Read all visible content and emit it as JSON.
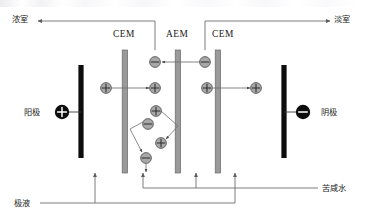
{
  "diagram": {
    "type": "electrodialysis-cell-schematic",
    "labels": {
      "concentrate_top_left": "浓室",
      "dilute_top_right": "淡室",
      "anode": "阳极",
      "cathode": "阴极",
      "electrode_solution_bottom_left": "极液",
      "brackish_water_bottom_right": "苦咸水"
    },
    "membranes": [
      {
        "id": "cem-1",
        "label": "CEM",
        "x": 125,
        "top": 50,
        "bottom": 173
      },
      {
        "id": "aem-1",
        "label": "AEM",
        "x": 178,
        "top": 50,
        "bottom": 173
      },
      {
        "id": "cem-2",
        "label": "CEM",
        "x": 218,
        "top": 50,
        "bottom": 173
      }
    ],
    "electrodes": [
      {
        "id": "anode",
        "polarity": "+",
        "sign_label": "+",
        "x": 81,
        "top": 65,
        "bottom": 158
      },
      {
        "id": "cathode",
        "polarity": "-",
        "sign_label": "−",
        "x": 284,
        "top": 65,
        "bottom": 158
      }
    ],
    "ions": [
      {
        "id": "anion-top-mid",
        "charge": "−",
        "cx": 155,
        "cy": 62
      },
      {
        "id": "anion-top-right",
        "charge": "−",
        "cx": 205,
        "cy": 62
      },
      {
        "id": "cation-left-outer",
        "charge": "+",
        "cx": 106,
        "cy": 88
      },
      {
        "id": "cation-left-inner",
        "charge": "+",
        "cx": 155,
        "cy": 88
      },
      {
        "id": "cation-right-outer",
        "charge": "+",
        "cx": 207,
        "cy": 88
      },
      {
        "id": "cation-right-inner",
        "charge": "+",
        "cx": 256,
        "cy": 88
      },
      {
        "id": "cation-cluster-top",
        "charge": "+",
        "cx": 156,
        "cy": 111
      },
      {
        "id": "anion-cluster-upper",
        "charge": "−",
        "cx": 148,
        "cy": 124
      },
      {
        "id": "cation-cluster-lower",
        "charge": "+",
        "cx": 161,
        "cy": 143
      },
      {
        "id": "anion-cluster-bottom",
        "charge": "−",
        "cx": 146,
        "cy": 158
      }
    ],
    "colors": {
      "membrane_fill": "#9a9a9a",
      "membrane_edge": "#6f6f6f",
      "electrode_fill": "#0d0d0d",
      "ion_fill": "#a8a8a8",
      "ion_edge": "#4a4a4a",
      "line": "#6d6d6d",
      "text": "#1b1b1b"
    }
  }
}
